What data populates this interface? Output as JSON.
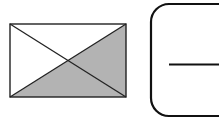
{
  "diagram": {
    "colors": {
      "background": "#ffffff",
      "stroke": "#222222",
      "shade": "#b3b3b3",
      "rounded_stroke": "#111111"
    },
    "rectangle": {
      "x1": 10,
      "y1": 24,
      "x2": 126,
      "y2": 97,
      "diagonals": true,
      "shaded_regions": [
        "right-triangle",
        "bottom-triangle"
      ]
    },
    "rounded_box": {
      "x": 151,
      "y": 4,
      "width": 90,
      "height": 112,
      "radius": 18
    },
    "inner_line": {
      "x1": 169,
      "y1": 64,
      "x2": 219,
      "y2": 64
    }
  }
}
